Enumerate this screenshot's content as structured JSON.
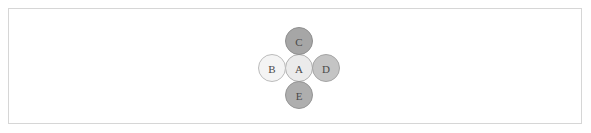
{
  "figure": {
    "background_color": "#ffffff",
    "frame": {
      "border_color": "#d6d6d6",
      "x": 8,
      "y": 8,
      "width": 574,
      "height": 116
    }
  },
  "chart_data": {
    "type": "diagram",
    "diagram_type": "node-link-graph",
    "layout": "star",
    "title": "",
    "xlabel": "",
    "ylabel": "",
    "grid": false,
    "legend": null,
    "nodes": [
      {
        "id": "A",
        "label": "A",
        "role": "center",
        "cx": 299,
        "cy": 68,
        "r": 13.5,
        "fill": "#ebebeb",
        "stroke": "#b0b0b0",
        "label_color": "#5a5a5a"
      },
      {
        "id": "B",
        "label": "B",
        "role": "leaf",
        "cx": 272,
        "cy": 68,
        "r": 13.5,
        "fill": "#f4f4f4",
        "stroke": "#bcbcbc",
        "label_color": "#5a5a5a"
      },
      {
        "id": "C",
        "label": "C",
        "role": "leaf",
        "cx": 299,
        "cy": 41,
        "r": 13.5,
        "fill": "#a6a6a6",
        "stroke": "#8f8f8f",
        "label_color": "#4a4a4a"
      },
      {
        "id": "D",
        "label": "D",
        "role": "leaf",
        "cx": 326,
        "cy": 68,
        "r": 13.5,
        "fill": "#c4c4c4",
        "stroke": "#a5a5a5",
        "label_color": "#4f4f4f"
      },
      {
        "id": "E",
        "label": "E",
        "role": "leaf",
        "cx": 299,
        "cy": 95,
        "r": 13.5,
        "fill": "#aeaeae",
        "stroke": "#959595",
        "label_color": "#4a4a4a"
      }
    ],
    "edges": [
      {
        "id": "A-B",
        "source": "A",
        "target": "B",
        "color": "#a8a8a8",
        "width": 1.6
      },
      {
        "id": "A-C",
        "source": "A",
        "target": "C",
        "color": "#a8a8a8",
        "width": 1.6
      },
      {
        "id": "A-D",
        "source": "A",
        "target": "D",
        "color": "#a8a8a8",
        "width": 1.6
      },
      {
        "id": "A-E",
        "source": "A",
        "target": "E",
        "color": "#a8a8a8",
        "width": 1.6
      }
    ],
    "node_count": 5,
    "edge_count": 4
  }
}
